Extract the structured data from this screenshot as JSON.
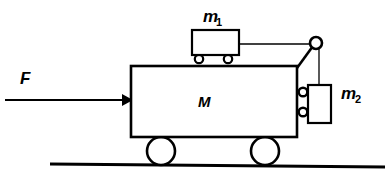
{
  "diagram": {
    "background_color": "#ffffff",
    "stroke_color": "#000000",
    "labels": {
      "force": "F",
      "big_cart": "M",
      "small_cart_base": "m",
      "small_cart_sub": "1",
      "hanging_block_base": "m",
      "hanging_block_sub": "2"
    },
    "parts": {
      "force_arrow": "force-arrow-F",
      "big_cart": "big-cart-M",
      "small_cart": "small-cart-m1",
      "hanging_block": "hanging-block-m2",
      "pulley": "pulley",
      "pulley_strut": "pulley-strut",
      "string_horizontal": "string-m1-to-pulley",
      "string_vertical": "string-pulley-to-m2",
      "ground": "ground-line",
      "wheel_left": "cart-wheel-left",
      "wheel_right": "cart-wheel-right",
      "small_wheel_left": "m1-wheel-left",
      "small_wheel_right": "m1-wheel-right",
      "roller_top": "m2-roller-top",
      "roller_bottom": "m2-roller-bottom"
    },
    "geometry": {
      "canvas_width": 389,
      "canvas_height": 184,
      "big_cart": {
        "x": 131,
        "y": 66,
        "w": 166,
        "h": 71
      },
      "small_cart": {
        "x": 192,
        "y": 30,
        "w": 47,
        "h": 25
      },
      "hanging_block": {
        "x": 308,
        "y": 85,
        "w": 23,
        "h": 38
      },
      "pulley": {
        "cx": 316,
        "cy": 43,
        "r": 6
      },
      "wheel_left": {
        "cx": 161,
        "cy": 151,
        "r": 14
      },
      "wheel_right": {
        "cx": 265,
        "cy": 151,
        "r": 14
      },
      "small_wheel_left": {
        "cx": 199,
        "cy": 59,
        "r": 4.2
      },
      "small_wheel_right": {
        "cx": 228,
        "cy": 59,
        "r": 4.2
      },
      "roller_top": {
        "cx": 303,
        "cy": 92,
        "r": 4.3
      },
      "roller_bottom": {
        "cx": 303,
        "cy": 112,
        "r": 4.3
      },
      "ground_line": {
        "x1": 50,
        "y1": 164,
        "x2": 385,
        "y2": 167
      },
      "force_arrow": {
        "x1": 5,
        "y1": 100,
        "x2": 131,
        "y2": 100
      },
      "string_horizontal": {
        "x1": 239,
        "y1": 44,
        "x2": 316,
        "y2": 44
      },
      "string_vertical": {
        "x1": 318,
        "y1": 49,
        "x2": 318,
        "y2": 85
      }
    },
    "label_positions": {
      "force": {
        "x": 20,
        "y": 84
      },
      "big_cart": {
        "x": 205,
        "y": 107
      },
      "small_cart": {
        "x": 206,
        "y": 22
      },
      "hanging_block": {
        "x": 343,
        "y": 99
      }
    }
  }
}
